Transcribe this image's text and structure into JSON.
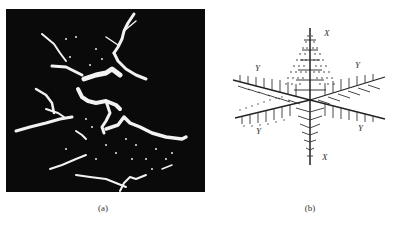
{
  "figure": {
    "panels": [
      {
        "id": "a",
        "caption": "(a)",
        "description": "Micrograph of dendritic crystal growth, white branches on black background"
      },
      {
        "id": "b",
        "caption": "(b)",
        "description": "Schematic 3D dendrite model with primary and secondary arms",
        "axis_labels": {
          "x_top": "X",
          "x_bottom": "X",
          "y_upper_left": "Y",
          "y_upper_right": "Y",
          "y_lower_left": "Y",
          "y_lower_right": "Y"
        }
      }
    ]
  }
}
